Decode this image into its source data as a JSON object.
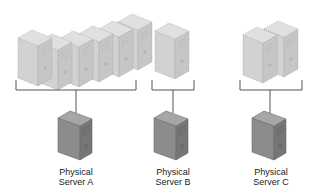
{
  "diagram": {
    "type": "server-virtualization",
    "colors": {
      "vm_fill": "#d6d6d6",
      "vm_side": "#c4c4c4",
      "vm_top": "#e2e2e2",
      "vm_dots": "#9a9a9a",
      "bracket": "#555555",
      "server_front": "#8a8a8a",
      "server_side": "#6f6f6f",
      "server_top": "#a8a8a8"
    },
    "groups": [
      {
        "id": "A",
        "virtual_machines": 5,
        "server": {
          "label_line1": "Physical",
          "label_line2": "Server A"
        }
      },
      {
        "id": "B",
        "virtual_machines": 1,
        "server": {
          "label_line1": "Physical",
          "label_line2": "Server B"
        }
      },
      {
        "id": "C",
        "virtual_machines": 2,
        "server": {
          "label_line1": "Physical",
          "label_line2": "Server C"
        }
      }
    ]
  }
}
